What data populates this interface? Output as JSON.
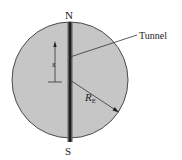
{
  "diagram": {
    "labels": {
      "north": "N",
      "south": "S",
      "tunnel": "Tunnel",
      "displacement": "s",
      "radius_main": "R",
      "radius_sub": "E"
    },
    "colors": {
      "earth_fill": "#c6c6c6",
      "earth_stroke": "#4a4a4a",
      "tunnel_fill": "#3c3c3c",
      "tunnel_core": "#1e1e1e",
      "line": "#333333"
    }
  }
}
